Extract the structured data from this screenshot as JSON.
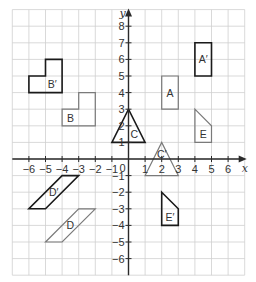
{
  "diagram": {
    "type": "coordinate-grid-transformations",
    "axes": {
      "x_label": "x",
      "y_label": "y",
      "origin_label": "0",
      "x_range": [
        -7,
        7
      ],
      "y_range": [
        -7,
        9
      ],
      "x_ticks": [
        -6,
        -5,
        -4,
        -3,
        -2,
        -1,
        1,
        2,
        3,
        4,
        5,
        6
      ],
      "y_ticks": [
        -6,
        -5,
        -4,
        -3,
        -2,
        -1,
        1,
        2,
        3,
        4,
        5,
        6,
        7,
        8
      ]
    },
    "colors": {
      "grid": "#cfcfcf",
      "axis": "#2a2a2a",
      "original_stroke": "#7a7a7a",
      "image_stroke": "#1a1a1a",
      "text": "#333333"
    },
    "shapes": [
      {
        "name": "B",
        "role": "original",
        "label": "B",
        "points": [
          [
            -4,
            2
          ],
          [
            -2,
            2
          ],
          [
            -2,
            4
          ],
          [
            -3,
            4
          ],
          [
            -3,
            3
          ],
          [
            -4,
            3
          ]
        ],
        "label_pos": [
          -3.5,
          2.5
        ]
      },
      {
        "name": "B'",
        "role": "image",
        "label": "B′",
        "points": [
          [
            -6,
            4
          ],
          [
            -4,
            4
          ],
          [
            -4,
            6
          ],
          [
            -5,
            6
          ],
          [
            -5,
            5
          ],
          [
            -6,
            5
          ]
        ],
        "label_pos": [
          -4.6,
          4.5
        ]
      },
      {
        "name": "A",
        "role": "original",
        "label": "A",
        "points": [
          [
            2,
            3
          ],
          [
            3,
            3
          ],
          [
            3,
            5
          ],
          [
            2,
            5
          ]
        ],
        "label_pos": [
          2.5,
          4
        ]
      },
      {
        "name": "A'",
        "role": "image",
        "label": "A′",
        "points": [
          [
            4,
            5
          ],
          [
            5,
            5
          ],
          [
            5,
            7
          ],
          [
            4,
            7
          ]
        ],
        "label_pos": [
          4.5,
          6
        ]
      },
      {
        "name": "C",
        "role": "image",
        "label": "C",
        "points": [
          [
            -1,
            1
          ],
          [
            1,
            1
          ],
          [
            0,
            3
          ]
        ],
        "label_pos": [
          0.35,
          1.5
        ]
      },
      {
        "name": "C'",
        "role": "original",
        "label": "C′",
        "points": [
          [
            1,
            -1
          ],
          [
            3,
            -1
          ],
          [
            2,
            1
          ]
        ],
        "label_pos": [
          2,
          0.3
        ]
      },
      {
        "name": "E",
        "role": "original",
        "label": "E",
        "points": [
          [
            4,
            3
          ],
          [
            5,
            2
          ],
          [
            5,
            1
          ],
          [
            4,
            1
          ]
        ],
        "label_pos": [
          4.5,
          1.5
        ]
      },
      {
        "name": "E'",
        "role": "image",
        "label": "E′",
        "points": [
          [
            2,
            -2
          ],
          [
            3,
            -3
          ],
          [
            3,
            -4
          ],
          [
            2,
            -4
          ]
        ],
        "label_pos": [
          2.5,
          -3.5
        ]
      },
      {
        "name": "D",
        "role": "original",
        "label": "D",
        "points": [
          [
            -5,
            -5
          ],
          [
            -4,
            -5
          ],
          [
            -2,
            -3
          ],
          [
            -3,
            -3
          ]
        ],
        "label_pos": [
          -3.5,
          -4
        ]
      },
      {
        "name": "D'",
        "role": "image",
        "label": "D′",
        "points": [
          [
            -6,
            -3
          ],
          [
            -5,
            -3
          ],
          [
            -3,
            -1
          ],
          [
            -4,
            -1
          ]
        ],
        "label_pos": [
          -4.5,
          -2
        ]
      }
    ]
  }
}
